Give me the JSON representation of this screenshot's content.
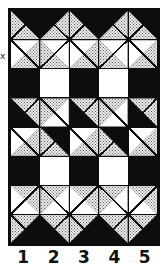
{
  "figure": {
    "description_label": "quilt-block pattern grid, 5 columns by 8 rows",
    "x_mark": "x",
    "column_labels": [
      "1",
      "2",
      "3",
      "4",
      "5"
    ]
  },
  "colors": {
    "black": "#0d0d0d",
    "white": "#ffffff",
    "stipple_background": "#ededed",
    "stipple_dot": "#5c5c5c"
  },
  "hst_legend": {
    "t": "cell type: solid or hst (half-square triangle)",
    "d": "diagonal: tlbr = top-left to bottom-right, bltr = bottom-left to top-right",
    "upper": "fill of upper triangle (upper-right for tlbr, upper-left for bltr)",
    "lower": "fill of lower triangle (lower-left for tlbr, lower-right for bltr)"
  },
  "grid": {
    "columns": 5,
    "rows": 8,
    "cells": [
      [
        {
          "t": "hst",
          "d": "tlbr",
          "upper": "black",
          "lower": "stipple"
        },
        {
          "t": "hst",
          "d": "bltr",
          "upper": "black",
          "lower": "stipple"
        },
        {
          "t": "hst",
          "d": "tlbr",
          "upper": "black",
          "lower": "stipple"
        },
        {
          "t": "hst",
          "d": "bltr",
          "upper": "black",
          "lower": "stipple"
        },
        {
          "t": "hst",
          "d": "tlbr",
          "upper": "black",
          "lower": "stipple"
        }
      ],
      [
        {
          "t": "hst",
          "d": "bltr",
          "upper": "white",
          "lower": "stipple"
        },
        {
          "t": "hst",
          "d": "tlbr",
          "upper": "white",
          "lower": "stipple"
        },
        {
          "t": "hst",
          "d": "bltr",
          "upper": "white",
          "lower": "stipple"
        },
        {
          "t": "hst",
          "d": "tlbr",
          "upper": "white",
          "lower": "stipple"
        },
        {
          "t": "hst",
          "d": "bltr",
          "upper": "white",
          "lower": "stipple"
        }
      ],
      [
        {
          "t": "solid",
          "f": "black"
        },
        {
          "t": "solid",
          "f": "white"
        },
        {
          "t": "solid",
          "f": "black"
        },
        {
          "t": "solid",
          "f": "white"
        },
        {
          "t": "solid",
          "f": "black"
        }
      ],
      [
        {
          "t": "hst",
          "d": "tlbr",
          "upper": "stipple",
          "lower": "black"
        },
        {
          "t": "hst",
          "d": "bltr",
          "upper": "stipple",
          "lower": "white"
        },
        {
          "t": "hst",
          "d": "tlbr",
          "upper": "stipple",
          "lower": "black"
        },
        {
          "t": "hst",
          "d": "bltr",
          "upper": "stipple",
          "lower": "white"
        },
        {
          "t": "hst",
          "d": "tlbr",
          "upper": "stipple",
          "lower": "black"
        }
      ],
      [
        {
          "t": "hst",
          "d": "bltr",
          "upper": "white",
          "lower": "stipple"
        },
        {
          "t": "hst",
          "d": "tlbr",
          "upper": "black",
          "lower": "stipple"
        },
        {
          "t": "hst",
          "d": "bltr",
          "upper": "white",
          "lower": "stipple"
        },
        {
          "t": "hst",
          "d": "tlbr",
          "upper": "black",
          "lower": "stipple"
        },
        {
          "t": "hst",
          "d": "bltr",
          "upper": "white",
          "lower": "stipple"
        }
      ],
      [
        {
          "t": "solid",
          "f": "black"
        },
        {
          "t": "solid",
          "f": "white"
        },
        {
          "t": "solid",
          "f": "black"
        },
        {
          "t": "solid",
          "f": "white"
        },
        {
          "t": "solid",
          "f": "black"
        }
      ],
      [
        {
          "t": "hst",
          "d": "tlbr",
          "upper": "stipple",
          "lower": "white"
        },
        {
          "t": "hst",
          "d": "bltr",
          "upper": "stipple",
          "lower": "white"
        },
        {
          "t": "hst",
          "d": "tlbr",
          "upper": "stipple",
          "lower": "white"
        },
        {
          "t": "hst",
          "d": "bltr",
          "upper": "stipple",
          "lower": "white"
        },
        {
          "t": "hst",
          "d": "tlbr",
          "upper": "stipple",
          "lower": "white"
        }
      ],
      [
        {
          "t": "hst",
          "d": "bltr",
          "upper": "stipple",
          "lower": "black"
        },
        {
          "t": "hst",
          "d": "tlbr",
          "upper": "stipple",
          "lower": "black"
        },
        {
          "t": "hst",
          "d": "bltr",
          "upper": "stipple",
          "lower": "black"
        },
        {
          "t": "hst",
          "d": "tlbr",
          "upper": "stipple",
          "lower": "black"
        },
        {
          "t": "hst",
          "d": "bltr",
          "upper": "stipple",
          "lower": "black"
        }
      ]
    ]
  }
}
